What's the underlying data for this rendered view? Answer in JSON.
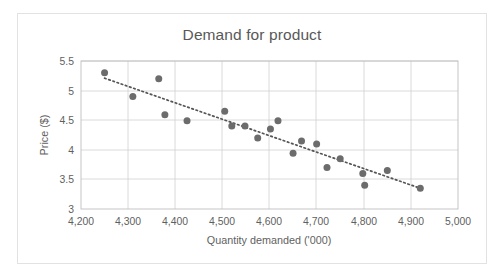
{
  "chart_data": {
    "type": "scatter",
    "title": "Demand for product",
    "xlabel": "Quantity demanded ('000)",
    "ylabel": "Price ($)",
    "xlim": [
      4200,
      5000
    ],
    "ylim": [
      3,
      5.5
    ],
    "xticks": [
      "4,200",
      "4,300",
      "4,400",
      "4,500",
      "4,600",
      "4,700",
      "4,800",
      "4,900",
      "5,000"
    ],
    "xtick_values": [
      4200,
      4300,
      4400,
      4500,
      4600,
      4700,
      4800,
      4900,
      5000
    ],
    "yticks": [
      "3",
      "3.5",
      "4",
      "4.5",
      "5",
      "5.5"
    ],
    "ytick_values": [
      3,
      3.5,
      4,
      4.5,
      5,
      5.5
    ],
    "grid": true,
    "legend": "none",
    "marker_color": "#6c6c6c",
    "gridline_color": "#d0d0d0",
    "text_color": "#5f5f5f",
    "series": [
      {
        "name": "Demand observations",
        "points": [
          [
            4250,
            5.3
          ],
          [
            4310,
            4.9
          ],
          [
            4365,
            5.2
          ],
          [
            4378,
            4.59
          ],
          [
            4425,
            4.49
          ],
          [
            4505,
            4.65
          ],
          [
            4520,
            4.4
          ],
          [
            4548,
            4.4
          ],
          [
            4575,
            4.2
          ],
          [
            4602,
            4.35
          ],
          [
            4618,
            4.49
          ],
          [
            4650,
            3.94
          ],
          [
            4668,
            4.15
          ],
          [
            4700,
            4.1
          ],
          [
            4722,
            3.7
          ],
          [
            4750,
            3.85
          ],
          [
            4798,
            3.6
          ],
          [
            4802,
            3.4
          ],
          [
            4850,
            3.65
          ],
          [
            4920,
            3.35
          ]
        ]
      }
    ],
    "trendline": {
      "type": "linear-dotted",
      "x_start": 4250,
      "y_start": 5.21,
      "x_end": 4920,
      "y_end": 3.35
    }
  }
}
